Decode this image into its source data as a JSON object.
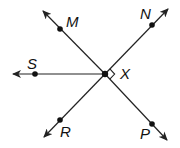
{
  "diagram": {
    "title": "",
    "colors": {
      "line": "#222222",
      "point": "#111111",
      "background": "#ffffff"
    },
    "center_point": {
      "label": "X",
      "x": 105,
      "y": 74
    },
    "points": [
      {
        "label": "M",
        "x": 60,
        "y": 29,
        "label_x": 66,
        "label_y": 27
      },
      {
        "label": "N",
        "x": 152,
        "y": 25,
        "label_x": 140,
        "label_y": 19
      },
      {
        "label": "S",
        "x": 35,
        "y": 74,
        "label_x": 27,
        "label_y": 69
      },
      {
        "label": "R",
        "x": 60,
        "y": 120,
        "label_x": 60,
        "label_y": 137
      },
      {
        "label": "P",
        "x": 152,
        "y": 124,
        "label_x": 140,
        "label_y": 139
      }
    ],
    "rays": [
      {
        "name": "ray-XM",
        "from": "X",
        "through": "M",
        "tip_x": 43,
        "tip_y": 11
      },
      {
        "name": "ray-XN",
        "from": "X",
        "through": "N",
        "tip_x": 168,
        "tip_y": 9
      },
      {
        "name": "ray-XS",
        "from": "X",
        "through": "S",
        "tip_x": 13,
        "tip_y": 74
      },
      {
        "name": "ray-XR",
        "from": "X",
        "through": "R",
        "tip_x": 44,
        "tip_y": 137
      },
      {
        "name": "ray-XP",
        "from": "X",
        "through": "P",
        "tip_x": 167,
        "tip_y": 140
      }
    ],
    "lines": [
      {
        "name": "line-MP",
        "description": "Line through M, X, P"
      },
      {
        "name": "line-NR",
        "description": "Line through N, X, R"
      }
    ],
    "right_angle_marker": {
      "vertex": "X",
      "between": [
        "N",
        "P"
      ]
    }
  }
}
